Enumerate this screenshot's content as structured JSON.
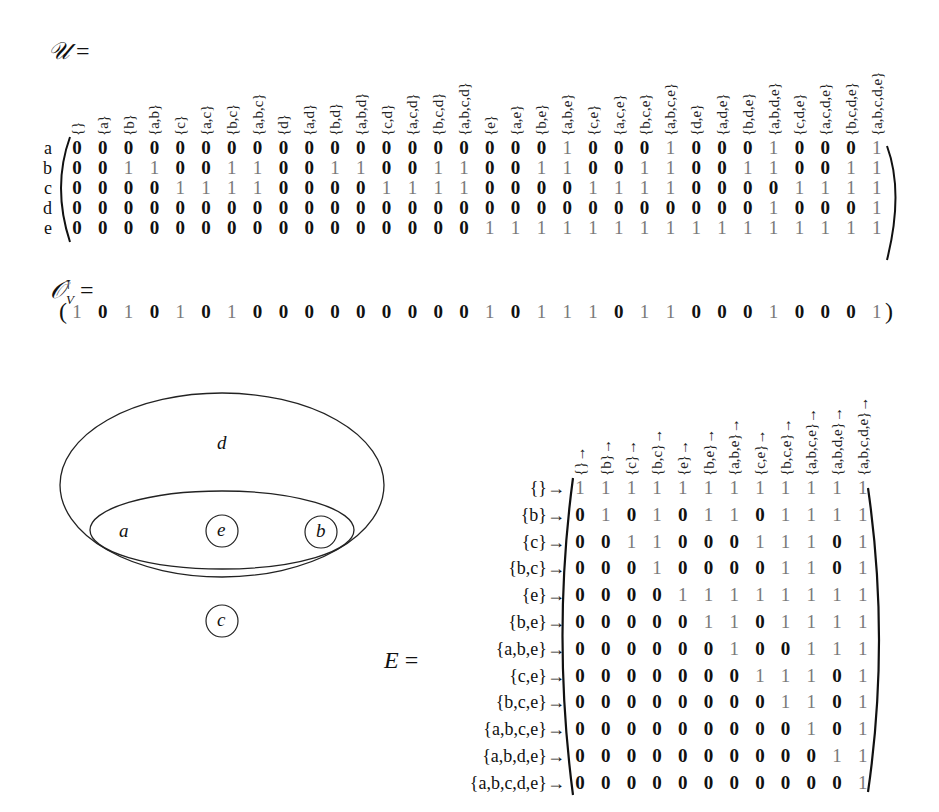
{
  "U": {
    "label": "𝒰",
    "equals": "=",
    "row_labels": [
      "a",
      "b",
      "c",
      "d",
      "e"
    ],
    "col_labels": [
      "{}",
      "{a}",
      "{b}",
      "{a,b}",
      "{c}",
      "{a,c}",
      "{b,c}",
      "{a,b,c}",
      "{d}",
      "{a,d}",
      "{b,d}",
      "{a,b,d}",
      "{c,d}",
      "{a,c,d}",
      "{b,c,d}",
      "{a,b,c,d}",
      "{e}",
      "{a,e}",
      "{b,e}",
      "{a,b,e}",
      "{c,e}",
      "{a,c,e}",
      "{b,c,e}",
      "{a,b,c,e}",
      "{d,e}",
      "{a,d,e}",
      "{b,d,e}",
      "{a,b,d,e}",
      "{c,d,e}",
      "{a,c,d,e}",
      "{b,c,d,e}",
      "{a,b,c,d,e}"
    ],
    "rows": [
      [
        0,
        0,
        0,
        0,
        0,
        0,
        0,
        0,
        0,
        0,
        0,
        0,
        0,
        0,
        0,
        0,
        0,
        0,
        0,
        1,
        0,
        0,
        0,
        1,
        0,
        0,
        0,
        1,
        0,
        0,
        0,
        1
      ],
      [
        0,
        0,
        1,
        1,
        0,
        0,
        1,
        1,
        0,
        0,
        1,
        1,
        0,
        0,
        1,
        1,
        0,
        0,
        1,
        1,
        0,
        0,
        1,
        1,
        0,
        0,
        1,
        1,
        0,
        0,
        1,
        1
      ],
      [
        0,
        0,
        0,
        0,
        1,
        1,
        1,
        1,
        0,
        0,
        0,
        0,
        1,
        1,
        1,
        1,
        0,
        0,
        0,
        0,
        1,
        1,
        1,
        1,
        0,
        0,
        0,
        0,
        1,
        1,
        1,
        1
      ],
      [
        0,
        0,
        0,
        0,
        0,
        0,
        0,
        0,
        0,
        0,
        0,
        0,
        0,
        0,
        0,
        0,
        0,
        0,
        0,
        0,
        0,
        0,
        0,
        0,
        0,
        0,
        0,
        1,
        0,
        0,
        0,
        1
      ],
      [
        0,
        0,
        0,
        0,
        0,
        0,
        0,
        0,
        0,
        0,
        0,
        0,
        0,
        0,
        0,
        0,
        1,
        1,
        1,
        1,
        1,
        1,
        1,
        1,
        1,
        1,
        1,
        1,
        1,
        1,
        1,
        1
      ]
    ]
  },
  "OV": {
    "label": "𝒪",
    "subscript": "V",
    "superscript": "⊺",
    "equals": "=",
    "values": [
      1,
      0,
      1,
      0,
      1,
      0,
      1,
      0,
      0,
      0,
      0,
      0,
      0,
      0,
      0,
      0,
      1,
      0,
      1,
      1,
      1,
      0,
      1,
      1,
      0,
      0,
      0,
      1,
      0,
      0,
      0,
      1
    ]
  },
  "venn": {
    "labels": {
      "d": "d",
      "a": "a",
      "e": "e",
      "b": "b",
      "c": "c"
    }
  },
  "E": {
    "label": "E",
    "equals": "=",
    "row_labels": [
      "{}→",
      "{b}→",
      "{c}→",
      "{b,c}→",
      "{e}→",
      "{b,e}→",
      "{a,b,e}→",
      "{c,e}→",
      "{b,c,e}→",
      "{a,b,c,e}→",
      "{a,b,d,e}→",
      "{a,b,c,d,e}→"
    ],
    "col_labels": [
      "{}→",
      "{b}→",
      "{c}→",
      "{b,c}→",
      "{e}→",
      "{b,e}→",
      "{a,b,e}→",
      "{c,e}→",
      "{b,c,e}→",
      "{a,b,c,e}→",
      "{a,b,d,e}→",
      "{a,b,c,d,e}→"
    ],
    "rows": [
      [
        1,
        1,
        1,
        1,
        1,
        1,
        1,
        1,
        1,
        1,
        1,
        1
      ],
      [
        0,
        1,
        0,
        1,
        0,
        1,
        1,
        0,
        1,
        1,
        1,
        1
      ],
      [
        0,
        0,
        1,
        1,
        0,
        0,
        0,
        1,
        1,
        1,
        0,
        1
      ],
      [
        0,
        0,
        0,
        1,
        0,
        0,
        0,
        0,
        1,
        1,
        0,
        1
      ],
      [
        0,
        0,
        0,
        0,
        1,
        1,
        1,
        1,
        1,
        1,
        1,
        1
      ],
      [
        0,
        0,
        0,
        0,
        0,
        1,
        1,
        0,
        1,
        1,
        1,
        1
      ],
      [
        0,
        0,
        0,
        0,
        0,
        0,
        1,
        0,
        0,
        1,
        1,
        1
      ],
      [
        0,
        0,
        0,
        0,
        0,
        0,
        0,
        1,
        1,
        1,
        0,
        1
      ],
      [
        0,
        0,
        0,
        0,
        0,
        0,
        0,
        0,
        1,
        1,
        0,
        1
      ],
      [
        0,
        0,
        0,
        0,
        0,
        0,
        0,
        0,
        0,
        1,
        0,
        1
      ],
      [
        0,
        0,
        0,
        0,
        0,
        0,
        0,
        0,
        0,
        0,
        1,
        1
      ],
      [
        0,
        0,
        0,
        0,
        0,
        0,
        0,
        0,
        0,
        0,
        0,
        1
      ]
    ]
  },
  "colors": {
    "zero": "#111111",
    "one": "#7a7a7a"
  }
}
